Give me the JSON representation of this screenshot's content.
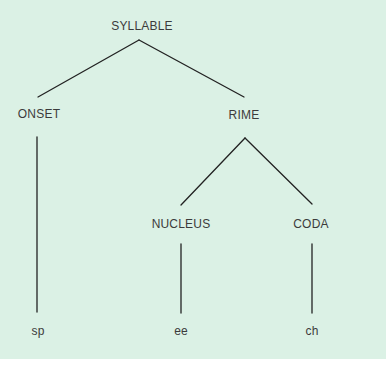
{
  "diagram": {
    "background_color": "#dbf1e5",
    "line_color": "#222222",
    "text_color": "#3b3b3b",
    "nodes": {
      "syllable": {
        "label": "SYLLABLE",
        "x": 142,
        "y": 20
      },
      "onset": {
        "label": "ONSET",
        "x": 39,
        "y": 108
      },
      "rime": {
        "label": "RIME",
        "x": 244,
        "y": 109
      },
      "nucleus": {
        "label": "NUCLEUS",
        "x": 181,
        "y": 218
      },
      "coda": {
        "label": "CODA",
        "x": 311,
        "y": 218
      },
      "onset_leaf": {
        "label": "sp",
        "x": 38,
        "y": 325
      },
      "nucleus_leaf": {
        "label": "ee",
        "x": 181,
        "y": 325
      },
      "coda_leaf": {
        "label": "ch",
        "x": 312,
        "y": 325
      }
    },
    "edges": [
      {
        "from": "syllable",
        "to": "onset"
      },
      {
        "from": "syllable",
        "to": "rime"
      },
      {
        "from": "rime",
        "to": "nucleus"
      },
      {
        "from": "rime",
        "to": "coda"
      },
      {
        "from": "onset",
        "to": "onset_leaf"
      },
      {
        "from": "nucleus",
        "to": "nucleus_leaf"
      },
      {
        "from": "coda",
        "to": "coda_leaf"
      }
    ]
  }
}
